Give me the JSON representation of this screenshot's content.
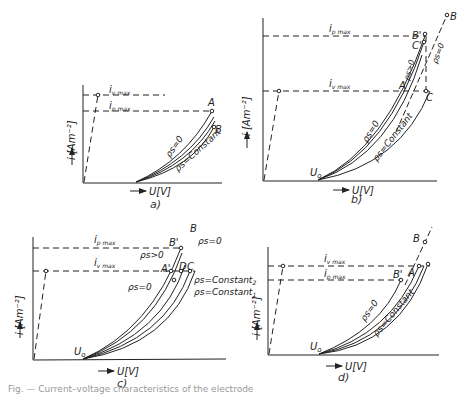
{
  "figure": {
    "panels": [
      {
        "id": "a",
        "caption": "a)",
        "xlabel": "U[V]",
        "ylabel": "i [Am⁻²]",
        "levels": [
          {
            "label": "i",
            "sub": "v max"
          },
          {
            "label": "i",
            "sub": "p max"
          }
        ],
        "curve_labels": [
          "ρs=0",
          "ρs=Constant"
        ],
        "points": [
          "A",
          "B"
        ]
      },
      {
        "id": "b",
        "caption": "b)",
        "xlabel": "U[V]",
        "ylabel": "i [Am⁻²]",
        "origin": "U₀",
        "levels": [
          {
            "label": "i",
            "sub": "p max"
          },
          {
            "label": "i",
            "sub": "v max"
          }
        ],
        "curve_labels": [
          "ρs=0",
          "ρs>0",
          "ρs=Constant",
          "ρs=0"
        ],
        "points": [
          "A",
          "B",
          "B'",
          "C",
          "C'",
          "C"
        ]
      },
      {
        "id": "c",
        "caption": "c)",
        "xlabel": "U[V]",
        "ylabel": "i [Am⁻²]",
        "origin": "U₀",
        "levels": [
          {
            "label": "i",
            "sub": "p max"
          },
          {
            "label": "i",
            "sub": "v max"
          }
        ],
        "curve_labels": [
          "ρs=0",
          "ρs>0",
          "ρs=0",
          "ρs=Constant₂",
          "ρs=Constant₁"
        ],
        "points": [
          "A'",
          "B",
          "B'",
          "C",
          "D"
        ]
      },
      {
        "id": "d",
        "caption": "d)",
        "xlabel": "U[V]",
        "ylabel": "i [Am⁻²]",
        "origin": "U₀",
        "levels": [
          {
            "label": "i",
            "sub": "v max"
          },
          {
            "label": "i",
            "sub": "p max"
          }
        ],
        "curve_labels": [
          "ρs=0",
          "ρs=Constant"
        ],
        "points": [
          "A",
          "B",
          "B'"
        ]
      }
    ],
    "caption_text": "Fig. — Current–voltage characteristics of the electrode"
  }
}
